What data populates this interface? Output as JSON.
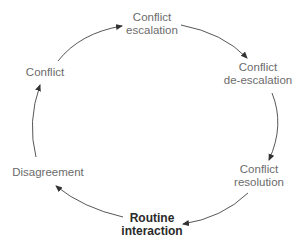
{
  "diagram": {
    "type": "cycle",
    "nodes": [
      {
        "id": "escalation",
        "lines": [
          "Conflict",
          "escalation"
        ],
        "emphasis": false
      },
      {
        "id": "de-escalation",
        "lines": [
          "Conflict",
          "de-escalation"
        ],
        "emphasis": false
      },
      {
        "id": "resolution",
        "lines": [
          "Conflict",
          "resolution"
        ],
        "emphasis": false
      },
      {
        "id": "routine",
        "lines": [
          "Routine",
          "interaction"
        ],
        "emphasis": true
      },
      {
        "id": "disagreement",
        "lines": [
          "Disagreement"
        ],
        "emphasis": false
      },
      {
        "id": "conflict",
        "lines": [
          "Conflict"
        ],
        "emphasis": false
      }
    ],
    "edges": [
      {
        "from": "conflict",
        "to": "escalation"
      },
      {
        "from": "escalation",
        "to": "de-escalation"
      },
      {
        "from": "de-escalation",
        "to": "resolution"
      },
      {
        "from": "resolution",
        "to": "routine"
      },
      {
        "from": "routine",
        "to": "disagreement"
      },
      {
        "from": "disagreement",
        "to": "conflict"
      }
    ],
    "colors": {
      "text": "#6b6b6b",
      "emphasis_text": "#2a2a2a",
      "arrow": "#333333"
    }
  }
}
